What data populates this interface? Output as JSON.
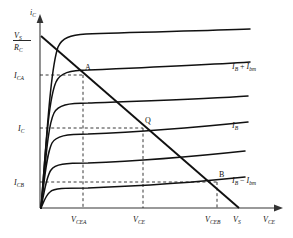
{
  "figure": {
    "background": "#ffffff",
    "line_color": "#111111",
    "axis_color": "#555555",
    "dash_color": "#333333"
  },
  "axes": {
    "y_axis_label": "i",
    "y_axis_sub": "C",
    "x_axis_label": "V",
    "x_axis_sub": "CE",
    "origin_px": [
      40,
      208
    ],
    "x_end_px": 282,
    "y_end_px": 16
  },
  "y_ticks": [
    {
      "id": "vs_over_rc",
      "kind": "fraction",
      "num_main": "V",
      "num_sub": "S",
      "den_main": "R",
      "den_sub": "C",
      "y_px": 40
    },
    {
      "id": "ica",
      "main": "I",
      "sub": "CA",
      "y_px": 75
    },
    {
      "id": "ic",
      "main": "I",
      "sub": "C",
      "y_px": 128
    },
    {
      "id": "icb",
      "main": "I",
      "sub": "CB",
      "y_px": 182
    }
  ],
  "x_ticks": [
    {
      "id": "vcea",
      "main": "V",
      "sub": "CEA",
      "x_px": 83
    },
    {
      "id": "vce",
      "main": "V",
      "sub": "CE",
      "x_px": 143
    },
    {
      "id": "vceb",
      "main": "V",
      "sub": "CEB",
      "x_px": 217
    },
    {
      "id": "vs",
      "main": "V",
      "sub": "S",
      "x_px": 238
    }
  ],
  "curve_labels": [
    {
      "id": "ib_plus_ibm",
      "text_parts": [
        "I",
        "B",
        " + ",
        "I",
        "bm"
      ],
      "x_px": 232,
      "y_px": 66
    },
    {
      "id": "ib",
      "text_parts": [
        "I",
        "B"
      ],
      "x_px": 232,
      "y_px": 125
    },
    {
      "id": "ib_minus_ibm",
      "text_parts": [
        "I",
        "B",
        " − ",
        "I",
        "bm"
      ],
      "x_px": 232,
      "y_px": 180
    }
  ],
  "operating_points": [
    {
      "id": "point-a",
      "label": "A",
      "x_px": 83,
      "y_px": 75,
      "label_dx": 2,
      "label_dy": -5
    },
    {
      "id": "point-q",
      "label": "Q",
      "x_px": 143,
      "y_px": 128,
      "label_dx": 2,
      "label_dy": -5
    },
    {
      "id": "point-b",
      "label": "B",
      "x_px": 217,
      "y_px": 182,
      "label_dx": 2,
      "label_dy": -5
    }
  ],
  "load_line": {
    "id": "dc-load-line",
    "from_px": [
      41,
      37
    ],
    "to_px": [
      238,
      208
    ]
  },
  "characteristic_curves": [
    {
      "id": "curve-1-top",
      "knee_px": [
        58,
        43
      ],
      "end_px": [
        250,
        31
      ]
    },
    {
      "id": "curve-2-ib-plus-ibm",
      "knee_px": [
        55,
        78
      ],
      "end_px": [
        250,
        62
      ]
    },
    {
      "id": "curve-3",
      "knee_px": [
        52,
        110
      ],
      "end_px": [
        248,
        97
      ]
    },
    {
      "id": "curve-4-ib",
      "knee_px": [
        50,
        140
      ],
      "end_px": [
        248,
        122
      ]
    },
    {
      "id": "curve-5",
      "knee_px": [
        48,
        168
      ],
      "end_px": [
        245,
        151
      ]
    },
    {
      "id": "curve-6-ib-minus-ibm",
      "knee_px": [
        47,
        192
      ],
      "end_px": [
        245,
        177
      ]
    }
  ],
  "dashed_guides": [
    {
      "id": "guide-ica-h",
      "orientation": "horizontal",
      "y_px": 75,
      "x_from": 40,
      "x_to": 83
    },
    {
      "id": "guide-ic-h",
      "orientation": "horizontal",
      "y_px": 128,
      "x_from": 40,
      "x_to": 143
    },
    {
      "id": "guide-icb-h",
      "orientation": "horizontal",
      "y_px": 182,
      "x_from": 40,
      "x_to": 217
    },
    {
      "id": "guide-vcea-v",
      "orientation": "vertical",
      "x_px": 83,
      "y_from": 75,
      "y_to": 208
    },
    {
      "id": "guide-vce-v",
      "orientation": "vertical",
      "x_px": 143,
      "y_from": 128,
      "y_to": 208
    },
    {
      "id": "guide-vceb-v",
      "orientation": "vertical",
      "x_px": 217,
      "y_from": 182,
      "y_to": 208
    }
  ]
}
